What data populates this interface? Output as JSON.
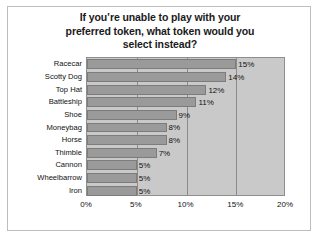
{
  "chart_data": {
    "type": "bar",
    "orientation": "horizontal",
    "title": "If you’re unable to play with your preferred token, what token would you select instead?",
    "title_lines": [
      "If you’re unable to play with your",
      "preferred token, what token would you",
      "select instead?"
    ],
    "categories": [
      "Racecar",
      "Scotty Dog",
      "Top Hat",
      "Battleship",
      "Shoe",
      "Moneybag",
      "Horse",
      "Thimble",
      "Cannon",
      "Wheelbarrow",
      "Iron"
    ],
    "values": [
      15,
      14,
      12,
      11,
      9,
      8,
      8,
      7,
      5,
      5,
      5
    ],
    "data_labels": [
      "15%",
      "14%",
      "12%",
      "11%",
      "9%",
      "8%",
      "8%",
      "7%",
      "5%",
      "5%",
      "5%"
    ],
    "xlabel": "",
    "ylabel": "",
    "xlim": [
      0,
      20
    ],
    "xticks": [
      0,
      5,
      10,
      15,
      20
    ],
    "xtick_labels": [
      "0%",
      "5%",
      "10%",
      "15%",
      "20%"
    ],
    "grid": true,
    "grid_axis": "x",
    "legend": false,
    "colors": {
      "bar_fill": "#9a9a9a",
      "bar_edge": "#7c7c7c",
      "plot_background": "#c9c9c9",
      "gridline": "#8a8a8a",
      "plot_border": "#8e8e8e",
      "text": "#111111",
      "figure_background": "#ffffff",
      "frame_border": "#bdbdbd"
    }
  }
}
